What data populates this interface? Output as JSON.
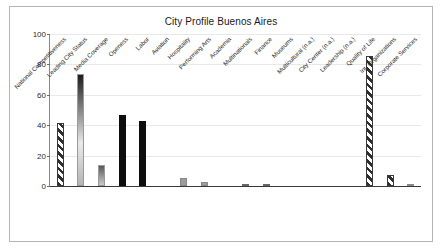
{
  "chart_data": {
    "type": "bar",
    "title": "City Profile Buenos Aires",
    "xlabel": "",
    "ylabel": "",
    "ylim": [
      0,
      100
    ],
    "yticks": [
      0,
      20,
      40,
      60,
      80,
      100
    ],
    "grid": true,
    "legend": "none",
    "categories": [
      "National Competitiveness",
      "Leading City Status",
      "Media Coverage",
      "Openess",
      "Labor",
      "Aviation",
      "Hospitality",
      "Performing Arts",
      "Academia",
      "Multinationals",
      "Finance",
      "Museums",
      "Multicultural (n.a.)",
      "City Center (n.a.)",
      "Leadership (n.a.)",
      "Quality of Life",
      "Int. Organizations",
      "Corporate Services"
    ],
    "values": [
      41.5,
      74,
      13.5,
      46.5,
      42.5,
      0,
      5.5,
      2.5,
      0,
      1.5,
      1.2,
      0,
      0,
      0,
      0,
      85.5,
      7,
      1
    ],
    "styles": [
      "hatch",
      "grad",
      "grad-short",
      "solid-black",
      "solid-black",
      "none",
      "flat-gray",
      "flat-gray",
      "none",
      "dark-gray",
      "dark-gray",
      "none",
      "none",
      "none",
      "none",
      "hatch",
      "hatch",
      "flat-gray"
    ]
  },
  "colors": {
    "figure_border": "#b4b4b4",
    "axis": "#3a3a3a",
    "gridline": "#e8e8e8",
    "bar_black": "#0d0d0d",
    "bar_gray": "#9c9c9c",
    "text": "#2b2b2b"
  }
}
